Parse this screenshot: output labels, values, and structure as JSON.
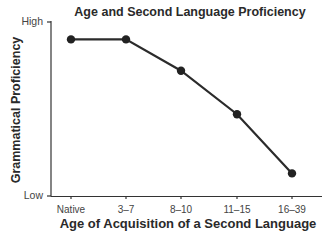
{
  "chart_data": {
    "type": "line",
    "title": "Age and Second Language Proficiency",
    "xlabel": "Age of Acquisition of a Second Language",
    "ylabel": "Grammatical Proficiency",
    "categories": [
      "Native",
      "3–7",
      "8–10",
      "11–15",
      "16–39"
    ],
    "series": [
      {
        "name": "Grammatical Proficiency",
        "values": [
          0.9,
          0.9,
          0.72,
          0.47,
          0.13
        ]
      }
    ],
    "y_ticks": [
      "Low",
      "High"
    ],
    "ylim": [
      0,
      1
    ],
    "grid": false,
    "legend": "none",
    "colors": {
      "line": "#2b2b2b",
      "marker": "#222222",
      "axis": "#333333"
    }
  },
  "labels": {
    "title": "Age and Second Language Proficiency",
    "xlabel": "Age of Acquisition of a Second Language",
    "ylabel": "Grammatical Proficiency",
    "y_high": "High",
    "y_low": "Low",
    "x_ticks": [
      "Native",
      "3–7",
      "8–10",
      "11–15",
      "16–39"
    ]
  }
}
